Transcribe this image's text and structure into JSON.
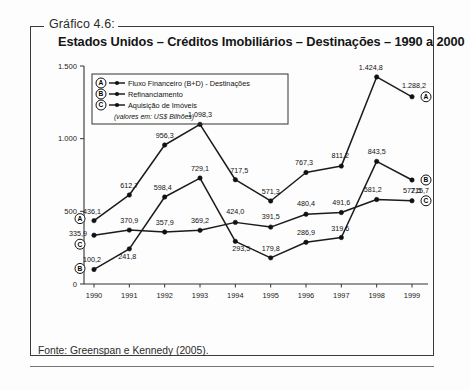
{
  "figure": {
    "caption_tag": "Gráfico 4.6:",
    "title": "Estados Unidos – Créditos Imobiliários – Destinações – 1990 a 2000",
    "source": "Fonte: Greenspan e Kennedy (2005)."
  },
  "legend": {
    "units_note": "(valores em: US$ Bilhões)",
    "entries": [
      {
        "badge": "A",
        "label": "Fluxo Financeiro  (B+D) - Destinações"
      },
      {
        "badge": "B",
        "label": "Refinanciamento"
      },
      {
        "badge": "C",
        "label": "Aquisição de Imóveis"
      }
    ]
  },
  "chart_data": {
    "type": "line",
    "title": "Estados Unidos – Créditos Imobiliários – Destinações – 1990 a 2000",
    "xlabel": "",
    "ylabel": "",
    "units": "US$ Bilhões",
    "grid": false,
    "legend_position": "top-left",
    "ylim": [
      0,
      1500
    ],
    "yticks": [
      0,
      500,
      1000,
      1500
    ],
    "ytick_labels": [
      "0",
      "500",
      "1.000",
      "1.500"
    ],
    "categories": [
      "1990",
      "1991",
      "1992",
      "1993",
      "1994",
      "1995",
      "1996",
      "1997",
      "1998",
      "1999"
    ],
    "series": [
      {
        "name": "Fluxo Financeiro  (B+D) - Destinações",
        "badge": "A",
        "values": [
          436.1,
          612.7,
          956.3,
          1098.3,
          717.5,
          571.3,
          767.3,
          811.2,
          1424.8,
          1288.2
        ],
        "value_labels": [
          "436,1",
          "612,7",
          "956,3",
          "1.098,3",
          "717,5",
          "571,3",
          "767,3",
          "811,2",
          "1.424,8",
          "1.288,2"
        ]
      },
      {
        "name": "Refinanciamento",
        "badge": "B",
        "values": [
          100.2,
          241.8,
          598.4,
          729.1,
          293.5,
          179.8,
          286.9,
          319.6,
          843.5,
          715.7
        ],
        "value_labels": [
          "100,2",
          "241,8",
          "598,4",
          "729,1",
          "293,5",
          "179,8",
          "286,9",
          "319,6",
          "843,5",
          "715,7"
        ]
      },
      {
        "name": "Aquisição de Imóveis",
        "badge": "C",
        "values": [
          335.9,
          370.9,
          357.9,
          369.2,
          424.0,
          391.5,
          480.4,
          491.6,
          581.2,
          572.5
        ],
        "value_labels": [
          "335,9",
          "370,9",
          "357,9",
          "369,2",
          "424,0",
          "391,5",
          "480,4",
          "491,6",
          "581,2",
          "572,5"
        ]
      }
    ]
  }
}
